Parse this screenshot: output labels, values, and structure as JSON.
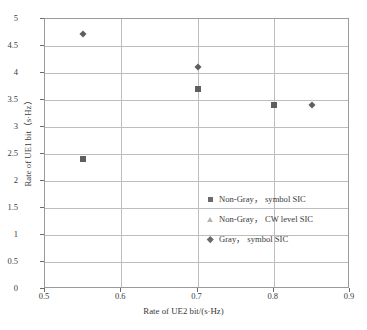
{
  "chart_data": {
    "type": "scatter",
    "title": "",
    "xlabel": "Rate of UE2 bit/(s·Hz)",
    "ylabel": "Rate of UE1 bit（s·Hz）",
    "xlim": [
      0.5,
      0.9
    ],
    "ylim": [
      0,
      5
    ],
    "xticks": [
      "0.5",
      "0.6",
      "0.7",
      "0.8",
      "0.9"
    ],
    "xtick_values": [
      0.5,
      0.6,
      0.7,
      0.8,
      0.9
    ],
    "yticks": [
      "0",
      "0.5",
      "1",
      "1.5",
      "2",
      "2.5",
      "3",
      "3.5",
      "4",
      "4.5",
      "5"
    ],
    "ytick_values": [
      0,
      0.5,
      1,
      1.5,
      2,
      2.5,
      3,
      3.5,
      4,
      4.5,
      5
    ],
    "grid": true,
    "grid_axis": "both",
    "legend_position": "center-right",
    "series": [
      {
        "name": "Non-Gray， symbol SIC",
        "marker": "square",
        "color": "#5e5e5e",
        "points": [
          {
            "x": 0.55,
            "y": 2.4
          },
          {
            "x": 0.7,
            "y": 3.7
          },
          {
            "x": 0.8,
            "y": 3.4
          }
        ]
      },
      {
        "name": "Non-Gray， CW level SIC",
        "marker": "triangle",
        "color": "#b0b0b0",
        "points": []
      },
      {
        "name": "Gray， symbol SIC",
        "marker": "diamond",
        "color": "#5e5e5e",
        "points": [
          {
            "x": 0.55,
            "y": 4.72
          },
          {
            "x": 0.7,
            "y": 4.11
          },
          {
            "x": 0.85,
            "y": 3.4
          }
        ]
      }
    ]
  },
  "axes": {
    "x_title": "Rate of UE2 bit/(s·Hz)",
    "y_title": "Rate of UE1 bit（s·Hz）"
  },
  "legend": {
    "items": [
      {
        "label": "Non-Gray， symbol SIC",
        "marker": "square"
      },
      {
        "label": "Non-Gray， CW level SIC",
        "marker": "triangle"
      },
      {
        "label": "Gray， symbol SIC",
        "marker": "diamond"
      }
    ]
  }
}
